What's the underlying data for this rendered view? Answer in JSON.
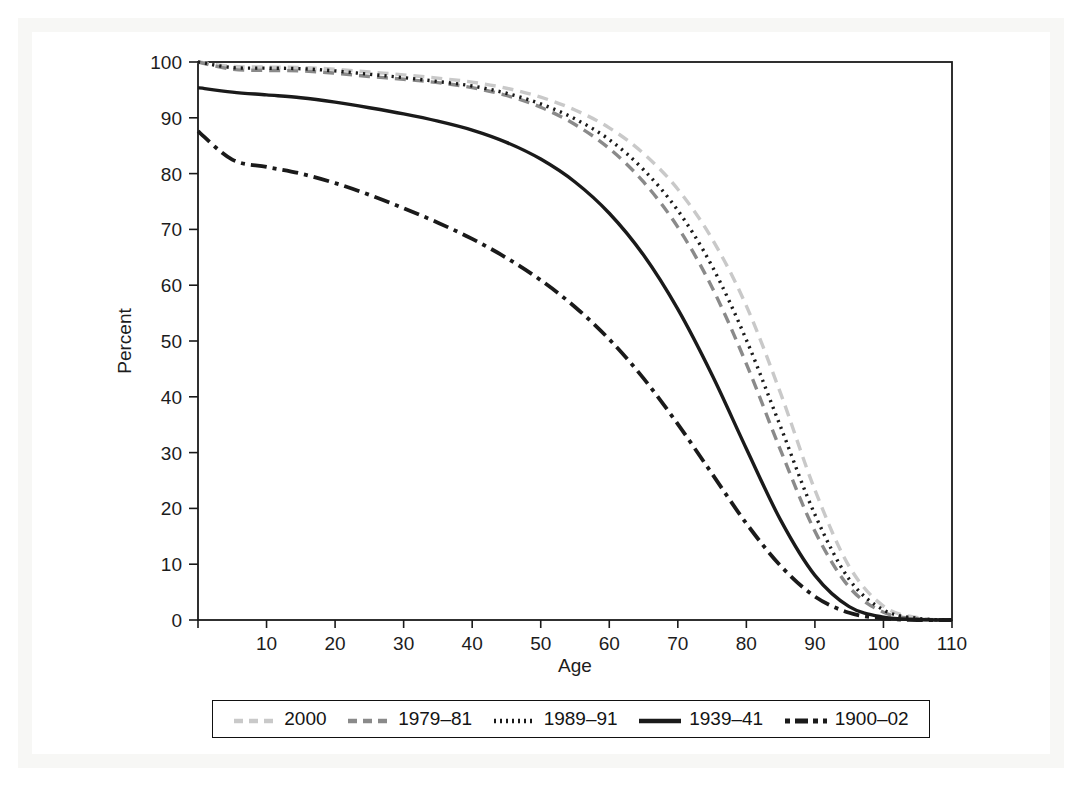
{
  "figure": {
    "name": "survivorship-curves",
    "background_color": "#ffffff",
    "frame_color": "#f7f7f5"
  },
  "axes": {
    "x": {
      "title": "Age",
      "min": 0,
      "max": 110,
      "ticks": [
        0,
        10,
        20,
        30,
        40,
        50,
        60,
        70,
        80,
        90,
        100,
        110
      ],
      "tick_labels": [
        "0",
        "10",
        "20",
        "30",
        "40",
        "50",
        "60",
        "70",
        "80",
        "90",
        "100",
        "110"
      ],
      "labeled_ticks": [
        "10",
        "20",
        "30",
        "40",
        "50",
        "60",
        "70",
        "80",
        "90",
        "100",
        "110"
      ]
    },
    "y": {
      "title": "Percent",
      "min": 0,
      "max": 100,
      "ticks": [
        0,
        10,
        20,
        30,
        40,
        50,
        60,
        70,
        80,
        90,
        100
      ],
      "tick_labels": [
        "0",
        "10",
        "20",
        "30",
        "40",
        "50",
        "60",
        "70",
        "80",
        "90",
        "100"
      ]
    }
  },
  "legend": {
    "position": "below-plot",
    "entries": [
      {
        "label": "2000",
        "style": "dashed",
        "color": "#c9c9c9"
      },
      {
        "label": "1979–81",
        "style": "dashed",
        "color": "#8a8a8a"
      },
      {
        "label": "1989–91",
        "style": "dotted",
        "color": "#1a1a1a"
      },
      {
        "label": "1939–41",
        "style": "solid",
        "color": "#1a1a1a"
      },
      {
        "label": "1900–02",
        "style": "dashdot",
        "color": "#1a1a1a"
      }
    ]
  },
  "chart_data": {
    "type": "line",
    "title": "",
    "subtitle": "",
    "xlabel": "Age",
    "ylabel": "Percent",
    "xlim": [
      0,
      110
    ],
    "ylim": [
      0,
      100
    ],
    "grid": false,
    "legend_position": "bottom",
    "x": [
      0,
      5,
      10,
      15,
      20,
      25,
      30,
      35,
      40,
      45,
      50,
      55,
      60,
      65,
      70,
      75,
      80,
      85,
      90,
      95,
      100,
      105,
      110
    ],
    "series": [
      {
        "name": "2000",
        "color": "#c9c9c9",
        "style": "dashed",
        "values": [
          100,
          99.2,
          99.1,
          99.0,
          98.7,
          98.2,
          97.7,
          97.1,
          96.4,
          95.3,
          93.7,
          91.4,
          88.2,
          83.6,
          77.2,
          68.3,
          56.3,
          40.6,
          23.3,
          9.6,
          2.5,
          0.4,
          0.0
        ]
      },
      {
        "name": "1979–81",
        "color": "#8a8a8a",
        "style": "dashed",
        "values": [
          100,
          98.7,
          98.5,
          98.4,
          98.0,
          97.4,
          96.9,
          96.3,
          95.4,
          94.0,
          91.9,
          88.8,
          84.5,
          78.5,
          70.4,
          59.6,
          45.9,
          30.4,
          15.9,
          5.9,
          1.4,
          0.2,
          0.0
        ]
      },
      {
        "name": "1989–91",
        "color": "#1a1a1a",
        "style": "dotted",
        "values": [
          100,
          99.0,
          98.9,
          98.8,
          98.4,
          97.8,
          97.2,
          96.5,
          95.7,
          94.4,
          92.5,
          89.8,
          86.1,
          80.7,
          73.4,
          63.4,
          50.2,
          34.6,
          18.9,
          7.3,
          1.8,
          0.3,
          0.0
        ]
      },
      {
        "name": "1939–41",
        "color": "#1a1a1a",
        "style": "solid",
        "values": [
          95.4,
          94.6,
          94.1,
          93.6,
          92.8,
          91.8,
          90.7,
          89.4,
          87.8,
          85.6,
          82.6,
          78.5,
          72.9,
          65.4,
          55.7,
          43.9,
          30.7,
          17.9,
          8.0,
          2.4,
          0.5,
          0.1,
          0.0
        ]
      },
      {
        "name": "1900–02",
        "color": "#1a1a1a",
        "style": "dashdot",
        "values": [
          87.6,
          82.5,
          81.2,
          80.0,
          78.3,
          76.2,
          73.8,
          71.2,
          68.3,
          64.9,
          60.9,
          56.1,
          50.3,
          43.3,
          35.1,
          26.2,
          17.3,
          9.7,
          4.2,
          1.3,
          0.3,
          0.0,
          0.0
        ]
      }
    ]
  }
}
